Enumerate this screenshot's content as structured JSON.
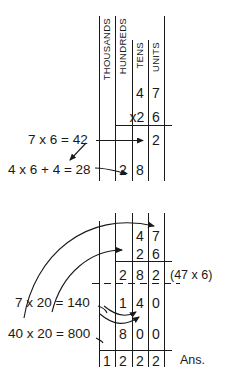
{
  "figure": {
    "ink_color": "#1a1a1a"
  },
  "columns": {
    "headers": [
      {
        "name": "thousands",
        "label": "THOUSANDS"
      },
      {
        "name": "hundreds",
        "label": "HUNDREDS"
      },
      {
        "name": "tens",
        "label": "TENS"
      },
      {
        "name": "units",
        "label": "UNITS"
      }
    ]
  },
  "top_block": {
    "rows": [
      {
        "name": "multiplicand",
        "thousands": "",
        "hundreds": "",
        "tens": "4",
        "units": "7"
      },
      {
        "name": "multiplier",
        "thousands": "",
        "hundreds": "",
        "tens": "x2",
        "units": "6"
      },
      {
        "name": "partial-units",
        "thousands": "",
        "hundreds": "",
        "tens": "",
        "units": "2"
      },
      {
        "name": "partial-tens",
        "thousands": "",
        "hundreds": "2",
        "tens": "8",
        "units": ""
      }
    ],
    "equations": [
      {
        "name": "seven-times-six",
        "text": "7 x 6 = 42"
      },
      {
        "name": "four-times-six-plus-four",
        "text": "4 x 6 + 4 = 28"
      }
    ]
  },
  "bottom_block": {
    "rows": [
      {
        "name": "multiplicand",
        "thousands": "",
        "hundreds": "",
        "tens": "4",
        "units": "7"
      },
      {
        "name": "multiplier",
        "thousands": "",
        "hundreds": "",
        "tens": "2",
        "units": "6"
      },
      {
        "name": "partial-product-first",
        "thousands": "",
        "hundreds": "2",
        "tens": "8",
        "units": "2"
      },
      {
        "name": "partial-product-tens",
        "thousands": "",
        "hundreds": "1",
        "tens": "4",
        "units": "0"
      },
      {
        "name": "partial-product-hundreds",
        "thousands": "",
        "hundreds": "8",
        "tens": "0",
        "units": "0"
      },
      {
        "name": "total",
        "thousands": "1",
        "hundreds": "2",
        "tens": "2",
        "units": "2"
      }
    ],
    "equations": [
      {
        "name": "seven-times-twenty",
        "text": "7 x 20 = 140"
      },
      {
        "name": "forty-times-twenty",
        "text": "40 x 20 = 800"
      }
    ],
    "annotation": {
      "name": "first-partial-product-note",
      "text": "(47 x 6)"
    },
    "answer_label": {
      "name": "answer-label",
      "text": "Ans."
    }
  }
}
